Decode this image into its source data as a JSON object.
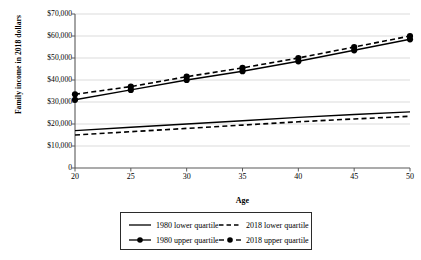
{
  "chart_data": {
    "type": "line",
    "title": "",
    "subtitle": "",
    "xlabel": "Age",
    "ylabel": "Family income in 2018 dollars",
    "x": [
      20,
      25,
      30,
      35,
      40,
      45,
      50
    ],
    "xtick_labels": [
      "20",
      "25",
      "30",
      "35",
      "40",
      "45",
      "50"
    ],
    "xlim": [
      20,
      50
    ],
    "ylim": [
      0,
      70000
    ],
    "ytick_values": [
      0,
      10000,
      20000,
      30000,
      40000,
      50000,
      60000,
      70000
    ],
    "ytick_labels": [
      "0",
      "$10,000",
      "$20,000",
      "$30,000",
      "$40,000",
      "$50,000",
      "$60,000",
      "$70,000"
    ],
    "grid": "horizontal",
    "legend_position": "bottom",
    "series": [
      {
        "name": "1980 lower quartile",
        "style": "solid",
        "markers": false,
        "color": "#000000",
        "values": [
          17000,
          18500,
          20000,
          21500,
          23000,
          24300,
          25500
        ]
      },
      {
        "name": "2018 lower quartile",
        "style": "dashed",
        "markers": false,
        "color": "#000000",
        "values": [
          15000,
          16500,
          18000,
          19500,
          21000,
          22300,
          23500
        ]
      },
      {
        "name": "1980 upper quartile",
        "style": "solid",
        "markers": true,
        "color": "#000000",
        "values": [
          31000,
          35500,
          40000,
          44000,
          48500,
          53500,
          58500
        ]
      },
      {
        "name": "2018 upper quartile",
        "style": "dashed",
        "markers": true,
        "color": "#000000",
        "values": [
          33500,
          37000,
          41500,
          45500,
          50000,
          55000,
          60000
        ]
      }
    ]
  },
  "legend": {
    "items": [
      {
        "label": "1980 lower quartile"
      },
      {
        "label": "2018 lower quartile"
      },
      {
        "label": "1980 upper quartile"
      },
      {
        "label": "2018 upper quartile"
      }
    ]
  },
  "colors": {
    "line": "#000000",
    "grid": "#cccccc",
    "axis": "#595959",
    "background": "#ffffff"
  }
}
